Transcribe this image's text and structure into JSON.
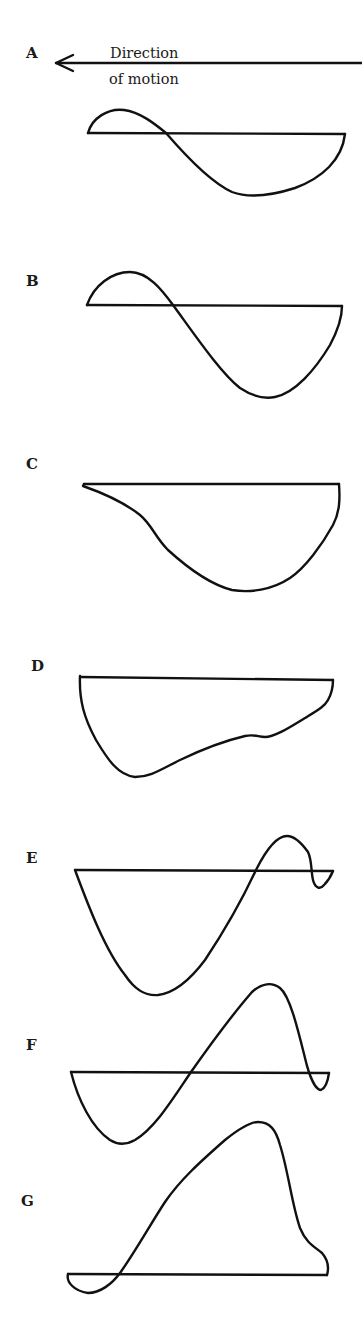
{
  "figure": {
    "direction_arrow": {
      "label_line1": "Direction",
      "label_line2": "of motion",
      "direction": "left"
    },
    "panels": [
      {
        "label": "A",
        "description": "Biphasic waveform: small positive lobe then large negative lobe"
      },
      {
        "label": "B",
        "description": "Biphasic waveform: positive lobe then deeper negative lobe"
      },
      {
        "label": "C",
        "description": "Monophasic negative waveform, trough toward right"
      },
      {
        "label": "D",
        "description": "Monophasic negative waveform, trough toward left with notch"
      },
      {
        "label": "E",
        "description": "Triphasic: large negative lobe, positive lobe, small terminal negative"
      },
      {
        "label": "F",
        "description": "Triphasic: negative lobe, large positive lobe, small terminal negative"
      },
      {
        "label": "G",
        "description": "Small initial negative then large positive lobe"
      }
    ],
    "colors": {
      "stroke": "#111111",
      "background": "#ffffff"
    }
  }
}
